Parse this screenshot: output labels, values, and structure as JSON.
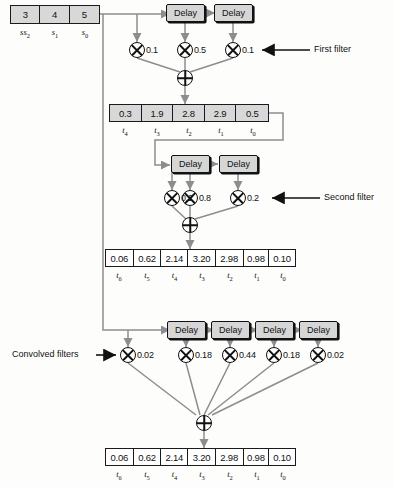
{
  "diagram": {
    "input_register": {
      "name": "input-signal-register",
      "values": [
        "3",
        "4",
        "5"
      ],
      "ticks": [
        "s2",
        "s1",
        "s0"
      ]
    },
    "stage1": {
      "label": "First filter",
      "delays": [
        "Delay",
        "Delay"
      ],
      "coefficients": [
        "0.1",
        "0.5",
        "0.1"
      ],
      "adder": "+",
      "multiplier": "x",
      "output_register": {
        "values": [
          "0.3",
          "1.9",
          "2.8",
          "2.9",
          "0.5"
        ],
        "ticks": [
          "t4",
          "t3",
          "t2",
          "t1",
          "t0"
        ]
      }
    },
    "stage2": {
      "label": "Second filter",
      "delays": [
        "Delay",
        "Delay"
      ],
      "coefficients": [
        "0.2",
        "0.8",
        "0.2"
      ],
      "adder": "+",
      "multiplier": "x",
      "output_register": {
        "values": [
          "0.06",
          "0.62",
          "2.14",
          "3.20",
          "2.98",
          "0.98",
          "0.10"
        ],
        "ticks": [
          "t6",
          "t5",
          "t4",
          "t3",
          "t2",
          "t1",
          "t0"
        ]
      }
    },
    "stage3": {
      "label": "Convolved filters",
      "delays": [
        "Delay",
        "Delay",
        "Delay",
        "Delay"
      ],
      "coefficients": [
        "0.02",
        "0.18",
        "0.44",
        "0.18",
        "0.02"
      ],
      "adder": "+",
      "multiplier": "x",
      "output_register": {
        "values": [
          "0.06",
          "0.62",
          "2.14",
          "3.20",
          "2.98",
          "0.98",
          "0.10"
        ],
        "ticks": [
          "t6",
          "t5",
          "t4",
          "t3",
          "t2",
          "t1",
          "t0"
        ]
      }
    },
    "colors": {
      "line": "#8d8d8d",
      "stroke": "#111111",
      "box_fill": "#d8d8d8",
      "background": "#ffffff"
    }
  }
}
